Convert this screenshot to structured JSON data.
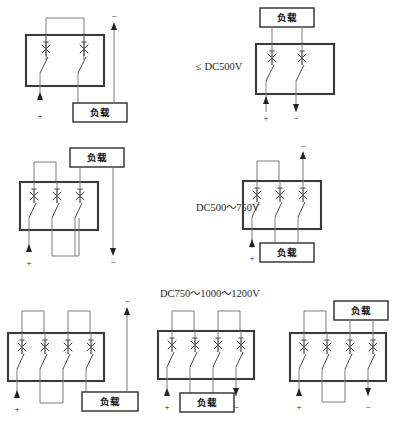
{
  "page": {
    "width": 398,
    "height": 424,
    "background": "#ffffff"
  },
  "colors": {
    "breaker_box_stroke": "#3a3a3a",
    "wire": "#7c7c7c",
    "text": "#1a1a1a",
    "label_text": "#2a2a2a"
  },
  "voltage_labels": [
    {
      "id": "row1",
      "text": "≤ DC500V"
    },
    {
      "id": "row2",
      "text": "DC500～750V"
    },
    {
      "id": "row3",
      "text": "DC750～1000～1200V"
    }
  ],
  "common": {
    "load_label": "负载",
    "polarity_positive": "+",
    "polarity_negative": "−",
    "switch_symbol_name": "circuit-breaker-pole"
  },
  "diagrams": [
    {
      "id": "d1",
      "name": "two-pole-series-left",
      "row": 1,
      "column": "left",
      "poles": 2,
      "load_label": "负载",
      "voltage_class": "≤ DC500V",
      "terminals": [
        {
          "polarity": "+",
          "position": "bottom-left"
        },
        {
          "polarity": "−",
          "position": "top-right"
        }
      ]
    },
    {
      "id": "d2",
      "name": "two-pole-load-top-right",
      "row": 1,
      "column": "right",
      "poles": 2,
      "load_label": "负载",
      "voltage_class": "≤ DC500V",
      "terminals": [
        {
          "polarity": "+",
          "position": "bottom-left"
        },
        {
          "polarity": "−",
          "position": "bottom-right"
        }
      ]
    },
    {
      "id": "d3",
      "name": "three-pole-load-top-left",
      "row": 2,
      "column": "left",
      "poles": 3,
      "load_label": "负载",
      "voltage_class": "DC500～750V",
      "terminals": [
        {
          "polarity": "+",
          "position": "bottom-left"
        },
        {
          "polarity": "−",
          "position": "bottom-right"
        }
      ]
    },
    {
      "id": "d4",
      "name": "three-pole-load-bottom-right",
      "row": 2,
      "column": "right",
      "poles": 3,
      "load_label": "负载",
      "voltage_class": "DC500～750V",
      "terminals": [
        {
          "polarity": "+",
          "position": "bottom-left"
        },
        {
          "polarity": "−",
          "position": "top-right"
        }
      ]
    },
    {
      "id": "d5",
      "name": "four-pole-load-bottom-right",
      "row": 3,
      "column": "left",
      "poles": 4,
      "load_label": "负载",
      "voltage_class": "DC750～1000～1200V",
      "terminals": [
        {
          "polarity": "+",
          "position": "bottom-left"
        },
        {
          "polarity": "−",
          "position": "top-right"
        }
      ]
    },
    {
      "id": "d6",
      "name": "four-pole-load-bottom-center",
      "row": 3,
      "column": "center",
      "poles": 4,
      "load_label": "负载",
      "voltage_class": "DC750～1000～1200V",
      "terminals": [
        {
          "polarity": "+",
          "position": "bottom-left"
        },
        {
          "polarity": "−",
          "position": "bottom-right"
        }
      ]
    },
    {
      "id": "d7",
      "name": "four-pole-load-top-right",
      "row": 3,
      "column": "right",
      "poles": 4,
      "load_label": "负载",
      "voltage_class": "DC750～1000～1200V",
      "terminals": [
        {
          "polarity": "+",
          "position": "bottom-left"
        },
        {
          "polarity": "−",
          "position": "bottom-right"
        }
      ]
    }
  ]
}
